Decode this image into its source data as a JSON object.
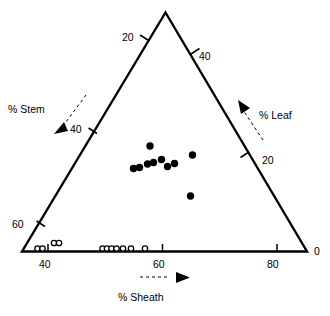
{
  "figure": {
    "type": "ternary-scatter",
    "background": "#ffffff",
    "ink_color": "#000000"
  },
  "axes": {
    "left": {
      "title": "% Stem",
      "title_pos": {
        "x": 8,
        "y": 104
      },
      "arrow": "down-left",
      "ticks": [
        {
          "label": "20",
          "pos": {
            "x": 122,
            "y": 32
          }
        },
        {
          "label": "40",
          "pos": {
            "x": 70,
            "y": 124
          }
        },
        {
          "label": "60",
          "pos": {
            "x": 12,
            "y": 219
          }
        }
      ]
    },
    "right": {
      "title": "% Leaf",
      "title_pos": {
        "x": 259,
        "y": 110
      },
      "arrow": "up-right",
      "ticks": [
        {
          "label": "40",
          "pos": {
            "x": 199,
            "y": 51
          }
        },
        {
          "label": "20",
          "pos": {
            "x": 262,
            "y": 155
          }
        },
        {
          "label": "0",
          "pos": {
            "x": 314,
            "y": 246
          }
        }
      ]
    },
    "bottom": {
      "title": "% Sheath",
      "title_pos": {
        "x": 118,
        "y": 292
      },
      "arrow": "right",
      "ticks": [
        {
          "label": "40",
          "pos": {
            "x": 39,
            "y": 259
          }
        },
        {
          "label": "60",
          "pos": {
            "x": 153,
            "y": 259
          }
        },
        {
          "label": "80",
          "pos": {
            "x": 267,
            "y": 259
          }
        }
      ]
    }
  },
  "chart_data": {
    "type": "scatter",
    "title": "",
    "subtitle": "",
    "xlabel": "% Sheath",
    "ylabel": "% Leaf",
    "zlabel": "% Stem",
    "grid": false,
    "legend": "none",
    "ternary": true,
    "axis_ranges": {
      "sheath": [
        30,
        90
      ],
      "leaf": [
        0,
        50
      ],
      "stem": [
        0,
        70
      ]
    },
    "tick_labels": {
      "stem": [
        "20",
        "40",
        "60"
      ],
      "leaf": [
        "40",
        "20",
        "0"
      ],
      "sheath": [
        "40",
        "60",
        "80"
      ]
    },
    "series": [
      {
        "name": "filled",
        "marker": "filled-circle",
        "color": "#000000",
        "size": 7.4,
        "points": [
          {
            "x": 150.0,
            "y": 146.0,
            "sheath": 57,
            "leaf": 22,
            "stem": 21
          },
          {
            "x": 133.5,
            "y": 168.5,
            "sheath": 54,
            "leaf": 16,
            "stem": 30
          },
          {
            "x": 139.5,
            "y": 167.5,
            "sheath": 55,
            "leaf": 16,
            "stem": 29
          },
          {
            "x": 147.5,
            "y": 164.0,
            "sheath": 56,
            "leaf": 17,
            "stem": 27
          },
          {
            "x": 153.5,
            "y": 162.5,
            "sheath": 57,
            "leaf": 18,
            "stem": 25
          },
          {
            "x": 161.5,
            "y": 159.5,
            "sheath": 58,
            "leaf": 19,
            "stem": 23
          },
          {
            "x": 167.5,
            "y": 166.5,
            "sheath": 60,
            "leaf": 17,
            "stem": 23
          },
          {
            "x": 174.5,
            "y": 163.5,
            "sheath": 61,
            "leaf": 18,
            "stem": 21
          },
          {
            "x": 192.5,
            "y": 155.0,
            "sheath": 64,
            "leaf": 20,
            "stem": 16
          },
          {
            "x": 190.5,
            "y": 196.0,
            "sheath": 69,
            "leaf": 11,
            "stem": 20
          }
        ]
      },
      {
        "name": "open",
        "marker": "open-circle",
        "color": "#000000",
        "size": 6.6,
        "points": [
          {
            "x": 37.5,
            "y": 248.5,
            "sheath": 38,
            "leaf": 0,
            "stem": 62
          },
          {
            "x": 42.5,
            "y": 248.5,
            "sheath": 39,
            "leaf": 0,
            "stem": 61
          },
          {
            "x": 54.0,
            "y": 243.0,
            "sheath": 41,
            "leaf": 1,
            "stem": 58
          },
          {
            "x": 59.0,
            "y": 243.0,
            "sheath": 42,
            "leaf": 1,
            "stem": 57
          },
          {
            "x": 102.5,
            "y": 248.5,
            "sheath": 52,
            "leaf": 0,
            "stem": 48
          },
          {
            "x": 107.0,
            "y": 248.5,
            "sheath": 53,
            "leaf": 0,
            "stem": 47
          },
          {
            "x": 111.5,
            "y": 248.5,
            "sheath": 54,
            "leaf": 0,
            "stem": 46
          },
          {
            "x": 116.5,
            "y": 248.5,
            "sheath": 54,
            "leaf": 0,
            "stem": 46
          },
          {
            "x": 123.0,
            "y": 248.5,
            "sheath": 56,
            "leaf": 0,
            "stem": 44
          },
          {
            "x": 131.0,
            "y": 248.5,
            "sheath": 57,
            "leaf": 0,
            "stem": 43
          },
          {
            "x": 145.0,
            "y": 248.5,
            "sheath": 60,
            "leaf": 0,
            "stem": 40
          }
        ]
      }
    ]
  },
  "geometry": {
    "apex": {
      "x": 165.5,
      "y": 12.5
    },
    "bottom_left": {
      "x": 22.0,
      "y": 251.5
    },
    "bottom_right": {
      "x": 307.0,
      "y": 251.5
    }
  }
}
